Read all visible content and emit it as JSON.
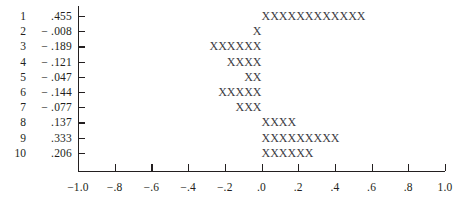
{
  "chart_data": {
    "type": "bar",
    "title": "",
    "subtitle": "",
    "xlabel": "",
    "ylabel": "",
    "orientation": "horizontal",
    "mark_glyph": "X",
    "grid": false,
    "legend": null,
    "xlim": [
      -1.0,
      1.0
    ],
    "xticks": [
      -1.0,
      -0.8,
      -0.6,
      -0.4,
      -0.2,
      0.0,
      0.2,
      0.4,
      0.6,
      0.8,
      1.0
    ],
    "xtick_labels": [
      "-1.0",
      "-.8",
      "-.6",
      "-.4",
      "-.2",
      ".0",
      ".2",
      ".4",
      ".6",
      ".8",
      "1.0"
    ],
    "categories": [
      "1",
      "2",
      "3",
      "4",
      "5",
      "6",
      "7",
      "8",
      "9",
      "10"
    ],
    "values": [
      0.455,
      -0.008,
      -0.189,
      -0.121,
      -0.047,
      -0.144,
      -0.077,
      0.137,
      0.333,
      0.206
    ],
    "value_labels": [
      ".455",
      "-.008",
      "-.189",
      "-.121",
      "-.047",
      "-.144",
      "-.077",
      ".137",
      ".333",
      ".206"
    ],
    "mark_counts": [
      12,
      1,
      6,
      4,
      2,
      5,
      3,
      4,
      9,
      6
    ],
    "rows": [
      {
        "index": "1",
        "value_label": ".455",
        "value": 0.455,
        "marks": "XXXXXXXXXXXX",
        "direction": "positive"
      },
      {
        "index": "2",
        "value_label": "-.008",
        "value": -0.008,
        "marks": "X",
        "direction": "negative"
      },
      {
        "index": "3",
        "value_label": "-.189",
        "value": -0.189,
        "marks": "XXXXXX",
        "direction": "negative"
      },
      {
        "index": "4",
        "value_label": "-.121",
        "value": -0.121,
        "marks": "XXXX",
        "direction": "negative"
      },
      {
        "index": "5",
        "value_label": "-.047",
        "value": -0.047,
        "marks": "XX",
        "direction": "negative"
      },
      {
        "index": "6",
        "value_label": "-.144",
        "value": -0.144,
        "marks": "XXXXX",
        "direction": "negative"
      },
      {
        "index": "7",
        "value_label": "-.077",
        "value": -0.077,
        "marks": "XXX",
        "direction": "negative"
      },
      {
        "index": "8",
        "value_label": ".137",
        "value": 0.137,
        "marks": "XXXX",
        "direction": "positive"
      },
      {
        "index": "9",
        "value_label": ".333",
        "value": 0.333,
        "marks": "XXXXXXXXX",
        "direction": "positive"
      },
      {
        "index": "10",
        "value_label": ".206",
        "value": 0.206,
        "marks": "XXXXXX",
        "direction": "positive"
      }
    ],
    "colors": {
      "background": "#ffffff",
      "axis": "#231f20",
      "text": "#231f20",
      "marks": "#3b3b42"
    }
  }
}
